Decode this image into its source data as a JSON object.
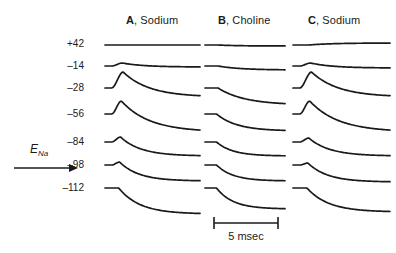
{
  "figure": {
    "background": "#ffffff",
    "ink": "#1a1a1a",
    "columns": [
      {
        "letter": "A",
        "label": ", Sodium",
        "x": 126,
        "y": 14
      },
      {
        "letter": "B",
        "label": ", Choline",
        "x": 218,
        "y": 14
      },
      {
        "letter": "C",
        "label": ", Sodium",
        "x": 308,
        "y": 14
      }
    ],
    "voltage_axis": {
      "unit": "mV",
      "labels": [
        {
          "text": "+42",
          "y": 38
        },
        {
          "text": "–14",
          "y": 60
        },
        {
          "text": "–28",
          "y": 82
        },
        {
          "text": "–56",
          "y": 108
        },
        {
          "text": "–84",
          "y": 136
        },
        {
          "text": "–98",
          "y": 159
        },
        {
          "text": "–112",
          "y": 182
        }
      ]
    },
    "reversal_annotation": {
      "symbol": "E",
      "subscript": "Na",
      "arrow_direction": "right"
    },
    "scale_bar": {
      "label": "5 msec",
      "length_px": 64
    }
  },
  "chart_data": {
    "type": "line",
    "title": "",
    "xlabel": "",
    "ylabel": "",
    "series_groups": [
      {
        "name": "A, Sodium",
        "baseline_x": 105,
        "width": 95,
        "traces": [
          {
            "level": "+42",
            "baseline": 45,
            "peak": 0,
            "peak_t": 0.1,
            "steady": 0,
            "tau": 0.3
          },
          {
            "level": "–14",
            "baseline": 66,
            "peak": -3,
            "peak_t": 0.12,
            "steady": 1,
            "tau": 0.28
          },
          {
            "level": "–28",
            "baseline": 88,
            "peak": -16,
            "peak_t": 0.13,
            "steady": 9,
            "tau": 0.34
          },
          {
            "level": "–56",
            "baseline": 114,
            "peak": -13,
            "peak_t": 0.11,
            "steady": 18,
            "tau": 0.36
          },
          {
            "level": "–84",
            "baseline": 142,
            "peak": -5,
            "peak_t": 0.1,
            "steady": 14,
            "tau": 0.26
          },
          {
            "level": "–98",
            "baseline": 165,
            "peak": -3,
            "peak_t": 0.09,
            "steady": 16,
            "tau": 0.24
          },
          {
            "level": "–112",
            "baseline": 188,
            "peak": 0,
            "peak_t": 0.08,
            "steady": 26,
            "tau": 0.26
          }
        ]
      },
      {
        "name": "B, Choline",
        "baseline_x": 205,
        "width": 80,
        "traces": [
          {
            "level": "+42",
            "baseline": 45,
            "peak": 0,
            "peak_t": 0.1,
            "steady": 1,
            "tau": 0.3
          },
          {
            "level": "–14",
            "baseline": 66,
            "peak": 0,
            "peak_t": 0.1,
            "steady": 4,
            "tau": 0.34
          },
          {
            "level": "–28",
            "baseline": 88,
            "peak": 0,
            "peak_t": 0.1,
            "steady": 17,
            "tau": 0.4
          },
          {
            "level": "–56",
            "baseline": 114,
            "peak": 0,
            "peak_t": 0.08,
            "steady": 17,
            "tau": 0.3
          },
          {
            "level": "–84",
            "baseline": 142,
            "peak": 0,
            "peak_t": 0.08,
            "steady": 14,
            "tau": 0.24
          },
          {
            "level": "–98",
            "baseline": 165,
            "peak": 0,
            "peak_t": 0.08,
            "steady": 16,
            "tau": 0.24
          },
          {
            "level": "–112",
            "baseline": 188,
            "peak": 0,
            "peak_t": 0.08,
            "steady": 21,
            "tau": 0.24
          }
        ]
      },
      {
        "name": "C, Sodium",
        "baseline_x": 293,
        "width": 97,
        "traces": [
          {
            "level": "+42",
            "baseline": 45,
            "peak": 0,
            "peak_t": 0.1,
            "steady": -2,
            "tau": 0.3
          },
          {
            "level": "–14",
            "baseline": 66,
            "peak": -3,
            "peak_t": 0.12,
            "steady": 2,
            "tau": 0.28
          },
          {
            "level": "–28",
            "baseline": 88,
            "peak": -16,
            "peak_t": 0.13,
            "steady": 9,
            "tau": 0.34
          },
          {
            "level": "–56",
            "baseline": 114,
            "peak": -13,
            "peak_t": 0.11,
            "steady": 18,
            "tau": 0.36
          },
          {
            "level": "–84",
            "baseline": 142,
            "peak": -4,
            "peak_t": 0.1,
            "steady": 14,
            "tau": 0.26
          },
          {
            "level": "–98",
            "baseline": 165,
            "peak": -2,
            "peak_t": 0.09,
            "steady": 17,
            "tau": 0.24
          },
          {
            "level": "–112",
            "baseline": 188,
            "peak": 0,
            "peak_t": 0.08,
            "steady": 24,
            "tau": 0.26
          }
        ]
      }
    ]
  }
}
